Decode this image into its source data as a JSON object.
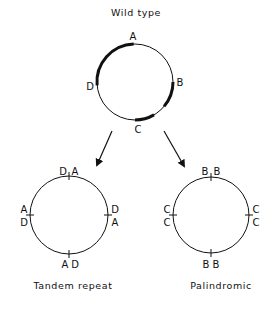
{
  "top": {
    "title": "Wild type",
    "labels": {
      "a": "A",
      "b": "B",
      "c": "C",
      "d": "D"
    }
  },
  "left": {
    "caption": "Tandem repeat",
    "top_labels": [
      "D",
      "A"
    ],
    "right_labels": [
      "D",
      "A"
    ],
    "bottom_labels": [
      "A",
      "D"
    ],
    "left_labels": [
      "A",
      "D"
    ]
  },
  "right": {
    "caption": "Palindromic",
    "top_labels": [
      "B",
      "B"
    ],
    "right_labels": [
      "C",
      "C"
    ],
    "bottom_labels": [
      "B",
      "B"
    ],
    "left_labels": [
      "C",
      "C"
    ]
  },
  "colors": {
    "line": "#111111",
    "background": "#ffffff"
  }
}
